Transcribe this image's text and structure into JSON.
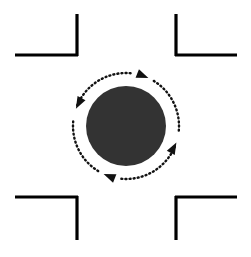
{
  "figure": {
    "title": "Rotating disc with counterclockwise motion arrows",
    "canvas": {
      "width": 251,
      "height": 257,
      "background": "#ffffff"
    },
    "colors": {
      "background": "#ffffff",
      "stroke": "#000000",
      "disc_fill": "#333333",
      "arrow": "#111111"
    }
  },
  "disc": {
    "label": "central-disc",
    "center_x": 126,
    "center_y": 126,
    "radius": 40,
    "fill": "#333333"
  },
  "brackets": [
    {
      "name": "top-left-bracket",
      "label": "Top left corner bracket",
      "corner": "top-left",
      "horizontal": {
        "x1": 15,
        "y1": 55,
        "x2": 78,
        "y2": 55
      },
      "vertical": {
        "x1": 77,
        "y1": 14,
        "x2": 77,
        "y2": 56
      }
    },
    {
      "name": "top-right-bracket",
      "label": "Top right corner bracket",
      "corner": "top-right",
      "horizontal": {
        "x1": 175,
        "y1": 55,
        "x2": 237,
        "y2": 55
      },
      "vertical": {
        "x1": 176,
        "y1": 14,
        "x2": 176,
        "y2": 56
      }
    },
    {
      "name": "bottom-left-bracket",
      "label": "Bottom left corner bracket",
      "corner": "bottom-left",
      "horizontal": {
        "x1": 15,
        "y1": 197,
        "x2": 78,
        "y2": 197
      },
      "vertical": {
        "x1": 77,
        "y1": 196,
        "x2": 77,
        "y2": 240
      }
    },
    {
      "name": "bottom-right-bracket",
      "label": "Bottom right corner bracket",
      "corner": "bottom-right",
      "horizontal": {
        "x1": 175,
        "y1": 197,
        "x2": 237,
        "y2": 197
      },
      "vertical": {
        "x1": 176,
        "y1": 196,
        "x2": 176,
        "y2": 240
      }
    }
  ],
  "arrows": [
    {
      "name": "arrow-top-left",
      "label": "Top-left dotted arc arrow pointing down-left",
      "direction": "counterclockwise",
      "start_angle_deg": 275,
      "end_angle_deg": 203,
      "head_angle_deg": 199,
      "arc_radius": 53,
      "head_rotation_deg": 118
    },
    {
      "name": "arrow-top-right",
      "label": "Top-right dotted arc arrow pointing up-left",
      "direction": "counterclockwise",
      "start_angle_deg": 5,
      "end_angle_deg": 299,
      "head_angle_deg": 295,
      "arc_radius": 53,
      "head_rotation_deg": 22
    },
    {
      "name": "arrow-bottom-left",
      "label": "Bottom-left dotted arc arrow pointing down-right",
      "direction": "counterclockwise",
      "start_angle_deg": 185,
      "end_angle_deg": 119,
      "head_angle_deg": 115,
      "arc_radius": 53,
      "head_rotation_deg": 202
    },
    {
      "name": "arrow-bottom-right",
      "label": "Bottom-right dotted arc arrow pointing up-right",
      "direction": "counterclockwise",
      "start_angle_deg": 95,
      "end_angle_deg": 22,
      "head_angle_deg": 18,
      "arc_radius": 53,
      "head_rotation_deg": 298
    }
  ],
  "style": {
    "bracket_stroke_width": 3.2,
    "arc_stroke_width": 2.4,
    "arc_dash": "1 3.1",
    "arrow_head_length": 12,
    "arrow_head_width": 9
  }
}
